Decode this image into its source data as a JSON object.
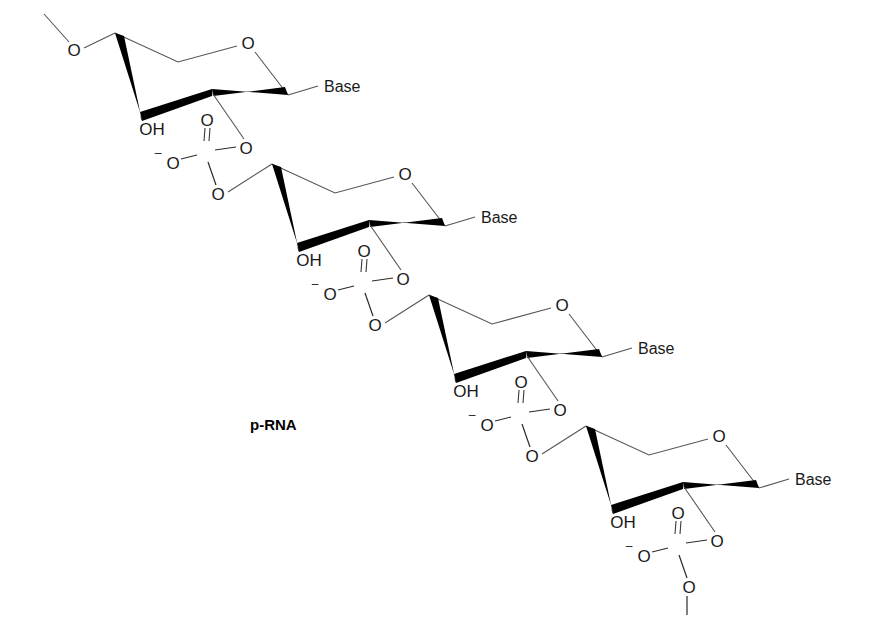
{
  "figure": {
    "caption": "p-RNA",
    "caption_x": 250,
    "caption_y": 430,
    "width": 877,
    "height": 644,
    "background_color": "#ffffff",
    "bond_color": "#2b2b2b",
    "thin_bond_color": "#555555",
    "text_color": "#1a1a1a"
  },
  "labels": {
    "ring_oxygen": "O",
    "hydroxyl": "OH",
    "phosphorus": "P",
    "oxygen": "O",
    "minus_sign": "–",
    "base": "Base"
  },
  "repeat_unit": {
    "dx": 157,
    "dy": 131,
    "count": 4
  },
  "units": [
    {
      "index": 1,
      "origin_x": 0,
      "origin_y": 0,
      "base_label": "Base",
      "hydroxyl_label": "OH",
      "ring_oxygen_label": "O",
      "phosphate": {
        "p_label": "P",
        "double_bond_oxygen": "O",
        "anionic_oxygen": "O",
        "anionic_charge": "–",
        "ester_oxygen_right": "O",
        "ester_oxygen_bottom": "O",
        "terminal": false
      }
    },
    {
      "index": 2,
      "origin_x": 157,
      "origin_y": 131,
      "base_label": "Base",
      "hydroxyl_label": "OH",
      "ring_oxygen_label": "O",
      "phosphate": {
        "p_label": "P",
        "double_bond_oxygen": "O",
        "anionic_oxygen": "O",
        "anionic_charge": "–",
        "ester_oxygen_right": "O",
        "ester_oxygen_bottom": "O",
        "terminal": false
      }
    },
    {
      "index": 3,
      "origin_x": 314,
      "origin_y": 262,
      "base_label": "Base",
      "hydroxyl_label": "OH",
      "ring_oxygen_label": "O",
      "phosphate": {
        "p_label": "P",
        "double_bond_oxygen": "O",
        "anionic_oxygen": "O",
        "anionic_charge": "–",
        "ester_oxygen_right": "O",
        "ester_oxygen_bottom": "O",
        "terminal": false
      }
    },
    {
      "index": 4,
      "origin_x": 471,
      "origin_y": 393,
      "base_label": "Base",
      "hydroxyl_label": "OH",
      "ring_oxygen_label": "O",
      "phosphate": {
        "p_label": "P",
        "double_bond_oxygen": "O",
        "anionic_oxygen": "O",
        "anionic_charge": "–",
        "ester_oxygen_right": "O",
        "ester_oxygen_bottom": "O",
        "terminal": true
      }
    }
  ],
  "chain_start": {
    "terminal_oxygen_label": "O",
    "terminal_oxygen_x": 74,
    "terminal_oxygen_y": 50,
    "continuation_bond_end_x": 44,
    "continuation_bond_end_y": 14
  }
}
